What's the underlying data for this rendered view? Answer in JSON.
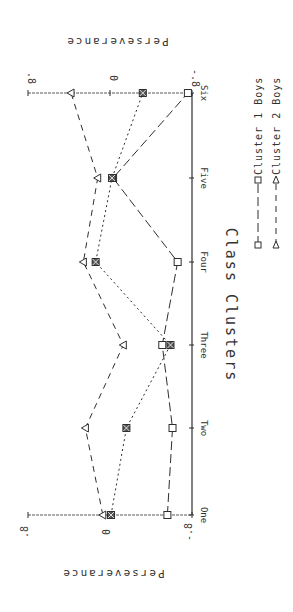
{
  "chart_data": {
    "type": "line",
    "orientation": "rotated-90-clockwise",
    "title": "Class Clusters",
    "xlabel": "",
    "ylabel": "Perseverance",
    "categories": [
      "One",
      "Two",
      "Three",
      "Four",
      "Five",
      "Six"
    ],
    "ylim": [
      -0.8,
      0.8
    ],
    "yticks": [
      -0.8,
      0,
      0.8
    ],
    "ytick_labels": [
      "-.8",
      "0",
      ".8"
    ],
    "grid": false,
    "legend_position": "right (bottom of unrotated chart)",
    "series": [
      {
        "name": "Cluster 1 Boys",
        "marker": "square",
        "line_style": "long-dash",
        "values": [
          -0.56,
          -0.61,
          -0.51,
          -0.66,
          -0.03,
          -0.76
        ]
      },
      {
        "name": "Cluster 2 Boys",
        "marker": "triangle",
        "line_style": "dash",
        "values": [
          0.07,
          0.24,
          -0.13,
          0.26,
          0.12,
          0.38
        ]
      },
      {
        "name": "",
        "marker": "crossed-square",
        "line_style": "dotted",
        "values": [
          -0.01,
          -0.16,
          -0.59,
          0.14,
          -0.02,
          -0.32
        ]
      }
    ]
  },
  "labels": {
    "title": "Class Clusters",
    "ylabel": "Perseverance",
    "categories": [
      "One",
      "Two",
      "Three",
      "Four",
      "Five",
      "Six"
    ],
    "yticks": [
      ".8",
      "0",
      "-.8"
    ],
    "legend": [
      "Cluster 1 Boys",
      "Cluster 2 Boys"
    ]
  },
  "style": {
    "ink": "#2e2e2e",
    "background": "#ffffff"
  }
}
